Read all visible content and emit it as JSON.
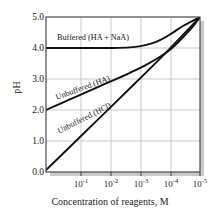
{
  "chart_data": {
    "type": "line",
    "title": "",
    "xlabel": "Concentration of reagents, M",
    "ylabel": "pH",
    "xtick_labels": [
      "10⁻¹",
      "10⁻²",
      "10⁻³",
      "10⁻⁴",
      "10⁻⁵"
    ],
    "xtick_mantissa": [
      "10",
      "10",
      "10",
      "10",
      "10"
    ],
    "xtick_exponents": [
      "-1",
      "-2",
      "-3",
      "-4",
      "-5"
    ],
    "x": [
      -1,
      -2,
      -3,
      -4,
      -5
    ],
    "xlim": [
      -0.6,
      -5.0
    ],
    "ylim": [
      0.0,
      5.0
    ],
    "ytick_labels": [
      "0.0",
      "1.0",
      "2.0",
      "3.0",
      "4.0",
      "5.0"
    ],
    "ytick_values": [
      0.0,
      1.0,
      2.0,
      3.0,
      4.0,
      5.0
    ],
    "grid": true,
    "grid_color": "#c9c9c9",
    "legend_position": "inline-annotations",
    "series": [
      {
        "name": "Buffered (HA + NaA)",
        "label": "Buffered (HA + NaA)",
        "color": "#111111",
        "x": [
          -0.6,
          -1.0,
          -1.5,
          -2.0,
          -2.5,
          -3.0,
          -3.3,
          -3.6,
          -3.9,
          -4.2,
          -4.5,
          -4.75,
          -5.0
        ],
        "values": [
          4.0,
          4.0,
          4.0,
          4.0,
          4.0,
          4.02,
          4.06,
          4.14,
          4.28,
          4.48,
          4.7,
          4.85,
          5.0
        ]
      },
      {
        "name": "Unbuffered (HA)",
        "label": "Unbuffered (HA)",
        "color": "#111111",
        "x": [
          -0.6,
          -1.0,
          -1.5,
          -2.0,
          -2.5,
          -3.0,
          -3.5,
          -4.0,
          -4.3,
          -4.6,
          -4.8,
          -5.0
        ],
        "values": [
          2.0,
          2.2,
          2.45,
          2.7,
          2.95,
          3.2,
          3.48,
          3.82,
          4.1,
          4.45,
          4.7,
          5.0
        ]
      },
      {
        "name": "Unbuffered (HCl)",
        "label": "Unbuffered (HCl)",
        "color": "#111111",
        "x": [
          -0.6,
          -1.0,
          -2.0,
          -3.0,
          -4.0,
          -5.0
        ],
        "values": [
          0.06,
          0.5,
          1.6,
          2.7,
          3.82,
          5.0
        ]
      }
    ]
  },
  "annotations": {
    "buffered": "Buffered (HA + NaA)",
    "unbuffered_ha": "Unbuffered (HA)",
    "unbuffered_hcl": "Unbuffered (HCl)"
  },
  "axes": {
    "y_title": "pH",
    "x_title": "Concentration of reagents, M"
  }
}
